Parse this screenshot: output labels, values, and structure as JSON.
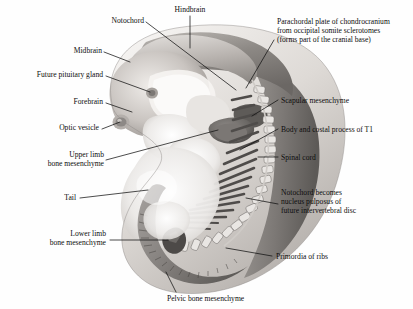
{
  "figure": {
    "kind": "anatomical-illustration",
    "style": "grayscale airbrush rendering",
    "background_color": "#fefefe",
    "ink_color": "#0d0d0d"
  },
  "labels": {
    "hindbrain": "Hindbrain",
    "notochord": "Notochord",
    "midbrain": "Midbrain",
    "future_pituitary_gland": "Future pituitary gland",
    "forebrain": "Forebrain",
    "optic_vesicle": "Optic vesicle",
    "upper_limb_l1": "Upper limb",
    "upper_limb_l2": "bone mesenchyme",
    "tail": "Tail",
    "lower_limb_l1": "Lower limb",
    "lower_limb_l2": "bone mesenchyme",
    "pelvic_bone_mesenchyme": "Pelvic bone mesenchyme",
    "parachordal_l1": "Parachordal plate of chondrocranium",
    "parachordal_l2": "from occipital somite sclerotomes",
    "parachordal_l3": "(forms part of the cranial base)",
    "scapular_mesenchyme": "Scapular mesenchyme",
    "body_costal_process_t1": "Body and costal process of T1",
    "spinal_cord": "Spinal cord",
    "notochord_becomes_l1": "Notochord becomes",
    "notochord_becomes_l2": "nucleus pulposus of",
    "notochord_becomes_l3": "future intervertebral disc",
    "primordia_of_ribs": "Primordia of ribs"
  },
  "structures": {
    "brain": "embryonic brain vesicles",
    "vertebral_column": "developing vertebral column",
    "ribs": "primordia of ribs",
    "tail": "embryonic tail",
    "limb_buds": "upper and lower limb buds"
  },
  "palette": {
    "ink": "#0d0d0d",
    "tissue_light": "#f1efed",
    "tissue_mid": "#cfcbc7",
    "tissue_dark": "#8f8b88",
    "cartilage": "#6f6c6a",
    "shadow": "#55524f"
  }
}
